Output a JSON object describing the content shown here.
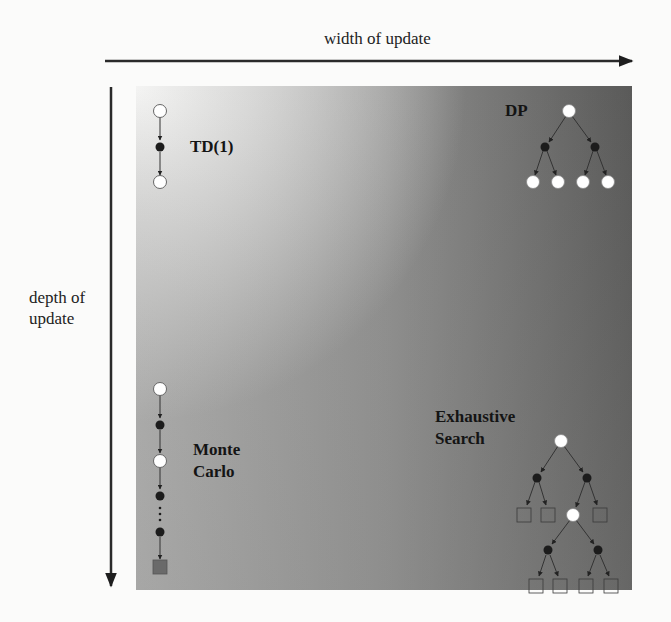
{
  "axes": {
    "x_label": "width of update",
    "y_label_line1": "depth of",
    "y_label_line2": "update"
  },
  "methods": {
    "td1": {
      "label": "TD(1)",
      "position": "top-left"
    },
    "dp": {
      "label": "DP",
      "position": "top-right"
    },
    "monte_carlo": {
      "label_line1": "Monte",
      "label_line2": "Carlo",
      "position": "bottom-left"
    },
    "exhaustive_search": {
      "label_line1": "Exhaustive",
      "label_line2": "Search",
      "position": "bottom-right"
    }
  },
  "legend_semantics": {
    "white_circle": "state",
    "black_circle": "action",
    "square": "terminal state"
  },
  "colors": {
    "panel_top_left": "#f4f4f3",
    "panel_top_right": "#4a4a4a",
    "panel_bottom_left": "#a2a2a1",
    "panel_bottom_right": "#555555",
    "state_node": "#ffffff",
    "action_node": "#1c1c1c",
    "terminal_fill_mc": "#6a6a6a",
    "arrow": "#222222"
  }
}
